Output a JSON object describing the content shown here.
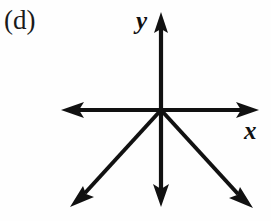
{
  "figure": {
    "part_label": "(d)",
    "axis_labels": {
      "y": "y",
      "x": "x"
    },
    "colors": {
      "ink": "#111111",
      "background": "#fefefe"
    },
    "origin": {
      "x": 161,
      "y": 110
    },
    "rays": [
      {
        "name": "positive-y-axis",
        "direction": "up",
        "angle_deg": 90,
        "tip": {
          "x": 161,
          "y": 13
        },
        "has_arrowhead": true
      },
      {
        "name": "negative-x-axis",
        "direction": "left",
        "angle_deg": 180,
        "tip": {
          "x": 62,
          "y": 110
        },
        "has_arrowhead": true
      },
      {
        "name": "positive-x-axis",
        "direction": "right",
        "angle_deg": 0,
        "tip": {
          "x": 258,
          "y": 110
        },
        "has_arrowhead": true
      },
      {
        "name": "negative-y-axis",
        "direction": "down",
        "angle_deg": 270,
        "tip": {
          "x": 161,
          "y": 206
        },
        "has_arrowhead": true
      },
      {
        "name": "down-left-diagonal",
        "direction": "down-left",
        "angle_deg": 223,
        "tip": {
          "x": 71,
          "y": 206
        },
        "has_arrowhead": true
      },
      {
        "name": "down-right-diagonal",
        "direction": "down-right",
        "angle_deg": 317,
        "tip": {
          "x": 252,
          "y": 207
        },
        "has_arrowhead": true
      }
    ]
  }
}
